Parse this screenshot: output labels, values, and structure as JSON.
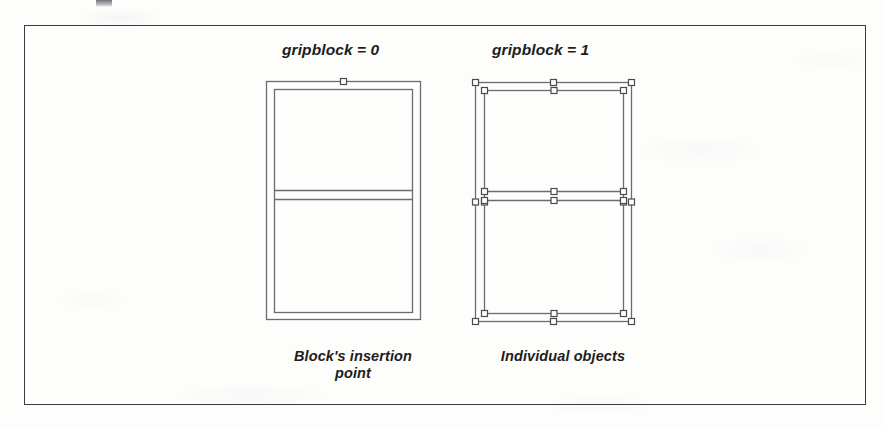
{
  "figure": {
    "type": "diagram",
    "frame": {
      "x": 24,
      "y": 25,
      "width": 842,
      "height": 380
    },
    "panels": [
      {
        "id": "left",
        "heading": "gripblock = 0",
        "caption_line1": "Block's insertion",
        "caption_line2": "point",
        "grip_count": 1,
        "grip_description": "single grip at block insertion point (top-center of outer rectangle)"
      },
      {
        "id": "right",
        "heading": "gripblock = 1",
        "caption_line1": "Individual objects",
        "caption_line2": "",
        "grip_count": 28,
        "grip_description": "grips on every corner and midpoint of each individual object"
      }
    ],
    "geometry": {
      "left_panel": {
        "outer_rect": {
          "x": 266,
          "y": 81,
          "width": 154,
          "height": 238
        },
        "inner_rect": {
          "x": 274,
          "y": 89,
          "width": 138,
          "height": 223
        },
        "divider_top": {
          "x1": 274,
          "y1": 190,
          "x2": 412,
          "y2": 190
        },
        "divider_bottom": {
          "x1": 274,
          "y1": 199,
          "x2": 412,
          "y2": 199
        }
      },
      "right_panel": {
        "outer_rect": {
          "x": 475,
          "y": 82,
          "width": 156,
          "height": 239
        },
        "inner_rect": {
          "x": 484,
          "y": 90,
          "width": 139,
          "height": 223
        },
        "divider_top": {
          "x1": 484,
          "y1": 191,
          "x2": 623,
          "y2": 191
        },
        "divider_bottom": {
          "x1": 484,
          "y1": 200,
          "x2": 623,
          "y2": 200
        }
      }
    }
  },
  "colors": {
    "page_background": "#fdfdfc",
    "frame_border": "#3b3b40",
    "line_stroke": "#6b6b70",
    "grip_stroke": "#4a4a50",
    "grip_fill": "#ffffff",
    "text": "#1d1d20"
  }
}
